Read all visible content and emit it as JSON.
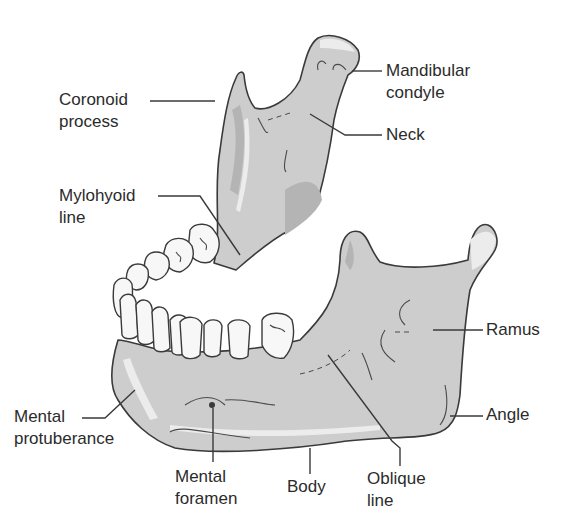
{
  "diagram": {
    "colors": {
      "bone": "#cdcdcd",
      "bone_shadow": "#b4b4b4",
      "bone_highlight": "#ececec",
      "tooth": "#f7f7f7",
      "outline": "#3a3a3a",
      "text": "#2b2b2b",
      "background": "#ffffff"
    },
    "labels": {
      "coronoid_process": {
        "line1": "Coronoid",
        "line2": "process"
      },
      "mandibular_condyle": {
        "line1": "Mandibular",
        "line2": "condyle"
      },
      "neck": {
        "line1": "Neck"
      },
      "mylohyoid_line": {
        "line1": "Mylohyoid",
        "line2": "line"
      },
      "ramus": {
        "line1": "Ramus"
      },
      "mental_protuberance": {
        "line1": "Mental",
        "line2": "protuberance"
      },
      "angle": {
        "line1": "Angle"
      },
      "mental_foramen": {
        "line1": "Mental",
        "line2": "foramen"
      },
      "body": {
        "line1": "Body"
      },
      "oblique_line": {
        "line1": "Oblique",
        "line2": "line"
      }
    }
  }
}
